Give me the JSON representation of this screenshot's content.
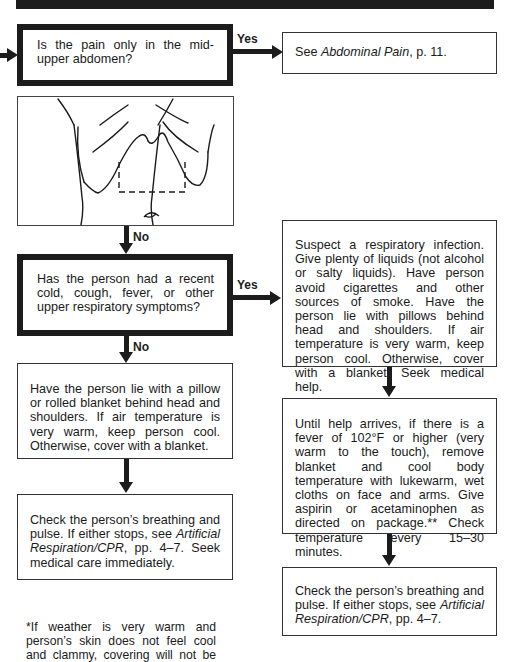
{
  "header": {
    "bar": "decorative-black-rule"
  },
  "flow": {
    "entry_arrow": "arrow-right",
    "q1": {
      "text": "Is the pain only in the mid-upper abdomen?"
    },
    "q1_yes": {
      "label": "Yes",
      "text_prefix": "See ",
      "ref": "Abdominal Pain",
      "text_suffix": ", p. 11."
    },
    "q1_no_label": "No",
    "illustration": {
      "description": "Torso line drawing with dashed box marking mid-upper abdomen region above navel"
    },
    "q2": {
      "text": "Has the person had a recent cold, cough, fever, or other upper respiratory symptoms?"
    },
    "q2_yes_label": "Yes",
    "q2_no_label": "No",
    "yes_path": [
      {
        "text": "Suspect a respiratory infection. Give plenty of liquids (not alcohol or salty liquids). Have person avoid cigarettes and other sources of smoke. Have the person lie with pillows behind head and shoulders. If air temperature is very warm, keep person cool. Otherwise, cover with a blanket. Seek medical help."
      },
      {
        "text": "Until help arrives, if there is a fever of 102°F or higher (very warm to the touch), remove blanket and cool body temperature with lukewarm, wet cloths on face and arms. Give aspirin or acetaminophen as directed on package.** Check temperature every 15–30 minutes."
      },
      {
        "text_prefix": "Check the person’s breathing and pulse. If either stops, see ",
        "ref": "Artificial Respiration/CPR",
        "text_suffix": ", pp. 4–7."
      }
    ],
    "no_path": [
      {
        "text": "Have the person lie with a pillow or rolled blanket behind head and shoulders. If air temperature is very warm, keep person cool. Otherwise, cover with a blanket."
      },
      {
        "text_prefix": "Check the person’s breathing and pulse. If either stops, see ",
        "ref": "Artificial Respiration/CPR",
        "text_suffix": ", pp. 4–7. Seek medical care immediately."
      }
    ]
  },
  "footnote": {
    "text": "*If weather is very warm and person’s skin does not feel cool and clammy, covering will not be"
  }
}
